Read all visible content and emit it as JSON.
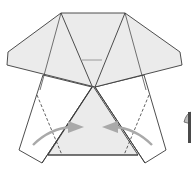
{
  "diagram": {
    "type": "origami-step",
    "colors": {
      "paper_colored": "#ebebeb",
      "paper_white": "#ffffff",
      "edge": "#3a3a3a",
      "arrow": "#a9a9a9"
    },
    "elements": {
      "top_flap": "top-flap",
      "left_strip": "left-strip",
      "right_strip": "right-strip",
      "center_triangle": "center-triangle",
      "valley_fold_left": "valley-fold-line-left",
      "valley_fold_right": "valley-fold-line-right",
      "arrow_left": "fold-arrow-left-to-center",
      "arrow_right": "fold-arrow-right-to-center",
      "next_step_symbol": "partial-symbol-right-edge"
    }
  }
}
